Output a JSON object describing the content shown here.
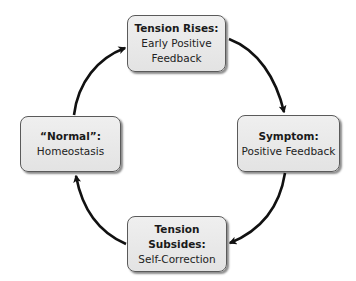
{
  "diagram": {
    "type": "cycle",
    "direction": "clockwise",
    "colors": {
      "node_fill": "#e8e8e8",
      "node_border": "#5a5a5a",
      "arrow": "#111111",
      "text": "#1a1a1a"
    },
    "nodes": {
      "top": {
        "title": "Tension Rises:",
        "subtitle_line1": "Early Positive",
        "subtitle_line2": "Feedback"
      },
      "right": {
        "title": "Symptom:",
        "subtitle_line1": "Positive Feedback"
      },
      "bottom": {
        "title_line1": "Tension",
        "title_line2": "Subsides:",
        "subtitle_line1": "Self-Correction"
      },
      "left": {
        "title": "“Normal”:",
        "subtitle_line1": "Homeostasis"
      }
    },
    "edges": [
      {
        "from": "top",
        "to": "right"
      },
      {
        "from": "right",
        "to": "bottom"
      },
      {
        "from": "bottom",
        "to": "left"
      },
      {
        "from": "left",
        "to": "top"
      }
    ]
  }
}
